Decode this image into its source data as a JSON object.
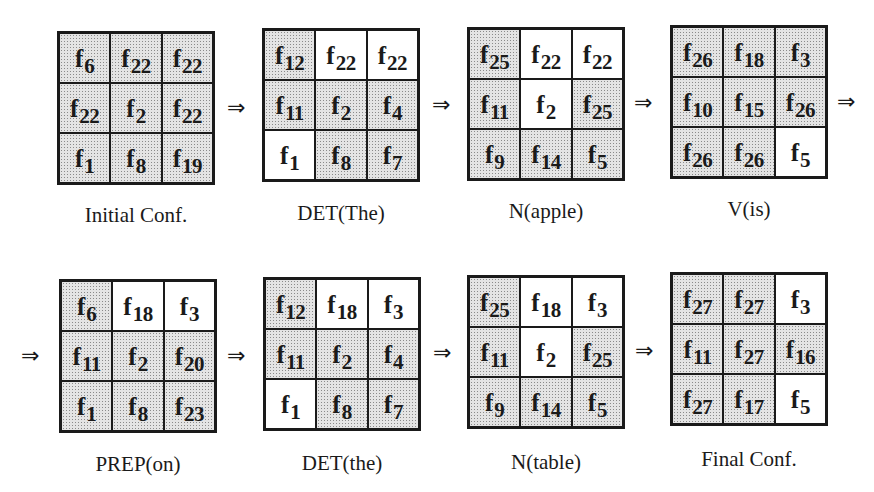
{
  "diagram": {
    "type": "state-transition-sequence",
    "arrow_symbol": "⇒",
    "subscript_prefix": "f",
    "configurations": [
      {
        "caption": "Initial Conf.",
        "cells": [
          {
            "label": "f",
            "sub": "6",
            "shaded": true
          },
          {
            "label": "f",
            "sub": "22",
            "shaded": true
          },
          {
            "label": "f",
            "sub": "22",
            "shaded": true
          },
          {
            "label": "f",
            "sub": "22",
            "shaded": true
          },
          {
            "label": "f",
            "sub": "2",
            "shaded": true
          },
          {
            "label": "f",
            "sub": "22",
            "shaded": true
          },
          {
            "label": "f",
            "sub": "1",
            "shaded": true
          },
          {
            "label": "f",
            "sub": "8",
            "shaded": true
          },
          {
            "label": "f",
            "sub": "19",
            "shaded": true
          }
        ]
      },
      {
        "caption": "DET(The)",
        "cells": [
          {
            "label": "f",
            "sub": "12",
            "shaded": true
          },
          {
            "label": "f",
            "sub": "22",
            "shaded": false
          },
          {
            "label": "f",
            "sub": "22",
            "shaded": false
          },
          {
            "label": "f",
            "sub": "11",
            "shaded": true
          },
          {
            "label": "f",
            "sub": "2",
            "shaded": true
          },
          {
            "label": "f",
            "sub": "4",
            "shaded": true
          },
          {
            "label": "f",
            "sub": "1",
            "shaded": false
          },
          {
            "label": "f",
            "sub": "8",
            "shaded": true
          },
          {
            "label": "f",
            "sub": "7",
            "shaded": true
          }
        ]
      },
      {
        "caption": "N(apple)",
        "cells": [
          {
            "label": "f",
            "sub": "25",
            "shaded": true
          },
          {
            "label": "f",
            "sub": "22",
            "shaded": false
          },
          {
            "label": "f",
            "sub": "22",
            "shaded": false
          },
          {
            "label": "f",
            "sub": "11",
            "shaded": true
          },
          {
            "label": "f",
            "sub": "2",
            "shaded": false
          },
          {
            "label": "f",
            "sub": "25",
            "shaded": true
          },
          {
            "label": "f",
            "sub": "9",
            "shaded": true
          },
          {
            "label": "f",
            "sub": "14",
            "shaded": true
          },
          {
            "label": "f",
            "sub": "5",
            "shaded": true
          }
        ]
      },
      {
        "caption": "V(is)",
        "cells": [
          {
            "label": "f",
            "sub": "26",
            "shaded": true
          },
          {
            "label": "f",
            "sub": "18",
            "shaded": true
          },
          {
            "label": "f",
            "sub": "3",
            "shaded": true
          },
          {
            "label": "f",
            "sub": "10",
            "shaded": true
          },
          {
            "label": "f",
            "sub": "15",
            "shaded": true
          },
          {
            "label": "f",
            "sub": "26",
            "shaded": true
          },
          {
            "label": "f",
            "sub": "26",
            "shaded": true
          },
          {
            "label": "f",
            "sub": "26",
            "shaded": true
          },
          {
            "label": "f",
            "sub": "5",
            "shaded": false
          }
        ]
      },
      {
        "caption": "PREP(on)",
        "cells": [
          {
            "label": "f",
            "sub": "6",
            "shaded": true
          },
          {
            "label": "f",
            "sub": "18",
            "shaded": false
          },
          {
            "label": "f",
            "sub": "3",
            "shaded": false
          },
          {
            "label": "f",
            "sub": "11",
            "shaded": true
          },
          {
            "label": "f",
            "sub": "2",
            "shaded": true
          },
          {
            "label": "f",
            "sub": "20",
            "shaded": true
          },
          {
            "label": "f",
            "sub": "1",
            "shaded": true
          },
          {
            "label": "f",
            "sub": "8",
            "shaded": true
          },
          {
            "label": "f",
            "sub": "23",
            "shaded": true
          }
        ]
      },
      {
        "caption": "DET(the)",
        "cells": [
          {
            "label": "f",
            "sub": "12",
            "shaded": true
          },
          {
            "label": "f",
            "sub": "18",
            "shaded": false
          },
          {
            "label": "f",
            "sub": "3",
            "shaded": false
          },
          {
            "label": "f",
            "sub": "11",
            "shaded": true
          },
          {
            "label": "f",
            "sub": "2",
            "shaded": true
          },
          {
            "label": "f",
            "sub": "4",
            "shaded": true
          },
          {
            "label": "f",
            "sub": "1",
            "shaded": false
          },
          {
            "label": "f",
            "sub": "8",
            "shaded": true
          },
          {
            "label": "f",
            "sub": "7",
            "shaded": true
          }
        ]
      },
      {
        "caption": "N(table)",
        "cells": [
          {
            "label": "f",
            "sub": "25",
            "shaded": true
          },
          {
            "label": "f",
            "sub": "18",
            "shaded": false
          },
          {
            "label": "f",
            "sub": "3",
            "shaded": false
          },
          {
            "label": "f",
            "sub": "11",
            "shaded": true
          },
          {
            "label": "f",
            "sub": "2",
            "shaded": false
          },
          {
            "label": "f",
            "sub": "25",
            "shaded": true
          },
          {
            "label": "f",
            "sub": "9",
            "shaded": true
          },
          {
            "label": "f",
            "sub": "14",
            "shaded": true
          },
          {
            "label": "f",
            "sub": "5",
            "shaded": true
          }
        ]
      },
      {
        "caption": "Final Conf.",
        "cells": [
          {
            "label": "f",
            "sub": "27",
            "shaded": true
          },
          {
            "label": "f",
            "sub": "27",
            "shaded": true
          },
          {
            "label": "f",
            "sub": "3",
            "shaded": false
          },
          {
            "label": "f",
            "sub": "11",
            "shaded": true
          },
          {
            "label": "f",
            "sub": "27",
            "shaded": true
          },
          {
            "label": "f",
            "sub": "16",
            "shaded": true
          },
          {
            "label": "f",
            "sub": "27",
            "shaded": true
          },
          {
            "label": "f",
            "sub": "17",
            "shaded": true
          },
          {
            "label": "f",
            "sub": "5",
            "shaded": false
          }
        ]
      }
    ]
  }
}
